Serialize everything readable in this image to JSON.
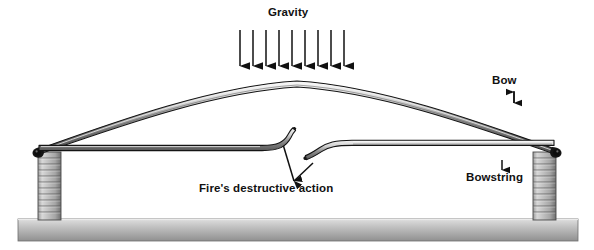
{
  "figure": {
    "type": "schematic-diagram",
    "background_color": "#ffffff",
    "ink_color": "#111111"
  },
  "labels": {
    "gravity": "Gravity",
    "bow": "Bow",
    "bowstring": "Bowstring",
    "fire": "Fire's destructive action"
  },
  "annotations": {
    "gravity": {
      "arrow_count": 9,
      "direction": "down",
      "arrow_x_positions": [
        240,
        253,
        266,
        279,
        292,
        305,
        318,
        331,
        344
      ],
      "arrow_top_y": 30,
      "arrow_tip_y": 76,
      "color": "#111111"
    },
    "bow_pointer": {
      "direction": "down",
      "x": 514,
      "top_y": 91,
      "tip_y": 111,
      "color": "#111111"
    },
    "bowstring_pointer": {
      "direction": "up",
      "x": 502,
      "bottom_y": 170,
      "tip_y": 152,
      "color": "#111111"
    },
    "fire_pointers": [
      {
        "from_x": 293,
        "from_y": 180,
        "to_x": 281,
        "to_y": 140,
        "direction": "up-left"
      },
      {
        "from_x": 293,
        "from_y": 180,
        "to_x": 313,
        "to_y": 157,
        "direction": "up-right"
      }
    ]
  },
  "geometry": {
    "bow": {
      "left_tip": [
        38,
        150
      ],
      "right_tip": [
        556,
        150
      ],
      "apex": [
        297,
        81
      ],
      "thickness_px": 6,
      "fill_top": "#f2f2f2",
      "fill_bottom": "#6e6e6e",
      "outline": "#151515"
    },
    "bowstring": {
      "y": 148,
      "left_x": 40,
      "right_x": 554,
      "thickness_px": 6,
      "break_left_end_x": 292,
      "break_right_end_x": 312,
      "fill_top": "#ededed",
      "fill_bottom": "#5f5f5f",
      "outline": "#151515"
    },
    "piers": [
      {
        "name": "left-pier",
        "x": 38,
        "y": 152,
        "width": 23,
        "height": 68,
        "band_count": 11
      },
      {
        "name": "right-pier",
        "x": 533,
        "y": 152,
        "width": 23,
        "height": 68,
        "band_count": 11
      }
    ],
    "ground": {
      "x": 18,
      "y": 219,
      "width": 560,
      "height": 22,
      "fill_top": "#d7d7d7",
      "fill_bottom": "#8e8e8e",
      "outline": "#6b6b6b"
    }
  },
  "chart_data": {
    "type": "diagram",
    "elements": [
      {
        "name": "Bow",
        "role": "arch (compression member)"
      },
      {
        "name": "Bowstring",
        "role": "tie (tension member), severed at mid-span"
      },
      {
        "name": "Gravity",
        "role": "distributed downward load, 9 arrows"
      },
      {
        "name": "Fire's destructive action",
        "role": "cause of bowstring failure"
      },
      {
        "name": "Piers",
        "role": "masonry supports, 2"
      },
      {
        "name": "Ground",
        "role": "foundation line"
      }
    ]
  }
}
